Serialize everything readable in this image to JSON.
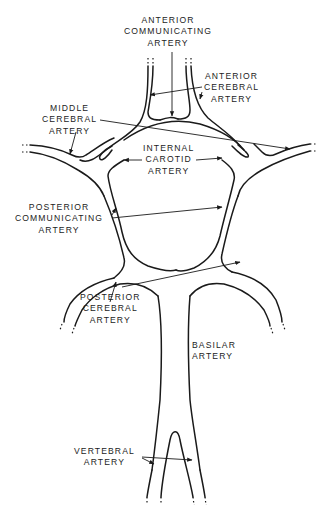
{
  "diagram": {
    "labels": {
      "anterior_communicating": [
        "ANTERIOR",
        "COMMUNICATING",
        "ARTERY"
      ],
      "anterior_cerebral": [
        "ANTERIOR",
        "CEREBRAL",
        "ARTERY"
      ],
      "middle_cerebral": [
        "MIDDLE",
        "CEREBRAL",
        "ARTERY"
      ],
      "internal_carotid": [
        "INTERNAL",
        "CAROTID",
        "ARTERY"
      ],
      "posterior_communicating": [
        "POSTERIOR",
        "COMMUNICATING",
        "ARTERY"
      ],
      "posterior_cerebral": [
        "POSTERIOR",
        "CEREBRAL",
        "ARTERY"
      ],
      "basilar": [
        "BASILAR",
        "ARTERY"
      ],
      "vertebral": [
        "VERTEBRAL",
        "ARTERY"
      ]
    },
    "colors": {
      "line": "#1a1a1a",
      "background": "#ffffff"
    }
  }
}
